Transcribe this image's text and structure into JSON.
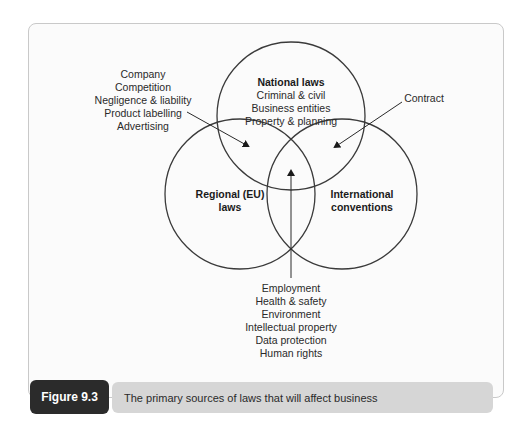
{
  "figure": {
    "label": "Figure 9.3",
    "caption": "The primary sources of laws that will affect business"
  },
  "circles": {
    "national": {
      "title": "National laws",
      "items": [
        "Criminal & civil",
        "Business entities",
        "Property & planning"
      ]
    },
    "regional": {
      "title_lines": [
        "Regional (EU)",
        "laws"
      ]
    },
    "international": {
      "title_lines": [
        "International",
        "conventions"
      ]
    }
  },
  "callouts": {
    "national_regional": {
      "items": [
        "Company",
        "Competition",
        "Negligence & liability",
        "Product labelling",
        "Advertising"
      ],
      "points_to": "National ∩ Regional overlap"
    },
    "national_international": {
      "items": [
        "Contract"
      ],
      "points_to": "National ∩ International overlap"
    },
    "all_three": {
      "items": [
        "Employment",
        "Health & safety",
        "Environment",
        "Intellectual property",
        "Data protection",
        "Human rights"
      ],
      "points_to": "Center overlap of all three"
    }
  },
  "colors": {
    "stroke": "#3a3a3a",
    "caption_label_bg": "#2b2b2b",
    "caption_bar_bg": "#d6d6d6",
    "panel_bg": "#fbfbfb"
  }
}
